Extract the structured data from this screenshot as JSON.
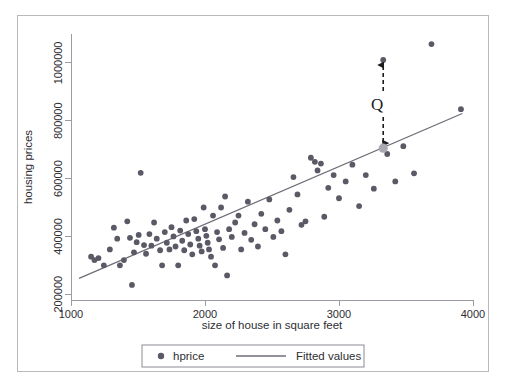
{
  "chart_data": {
    "type": "scatter",
    "title": "",
    "xlabel": "size of house in square feet",
    "ylabel": "housing prices",
    "xlim": [
      1000,
      4000
    ],
    "ylim": [
      180000,
      1100000
    ],
    "xticks": [
      1000,
      2000,
      3000,
      4000
    ],
    "xtick_labels": [
      "1000",
      "2000",
      "3000",
      "4000"
    ],
    "yticks": [
      200000,
      400000,
      600000,
      800000,
      1000000
    ],
    "ytick_labels": [
      "200000",
      "400000",
      "600000",
      "800000",
      "1000000"
    ],
    "grid": false,
    "legend_position": "below-plot",
    "marker_color": "#5a5a66",
    "line_color": "#6e6e78",
    "highlight_marker_color": "#a9a9b2",
    "annotation_color": "#1b1b1f",
    "legend": [
      {
        "label": "hprice",
        "kind": "marker"
      },
      {
        "label": "Fitted values",
        "kind": "line"
      }
    ],
    "series": [
      {
        "name": "hprice",
        "kind": "scatter",
        "points": [
          [
            1150,
            330000
          ],
          [
            1175,
            318000
          ],
          [
            1205,
            325000
          ],
          [
            1245,
            300000
          ],
          [
            1290,
            355000
          ],
          [
            1320,
            430000
          ],
          [
            1345,
            392000
          ],
          [
            1365,
            300000
          ],
          [
            1395,
            318000
          ],
          [
            1420,
            452000
          ],
          [
            1440,
            395000
          ],
          [
            1455,
            232000
          ],
          [
            1470,
            345000
          ],
          [
            1490,
            380000
          ],
          [
            1505,
            405000
          ],
          [
            1520,
            620000
          ],
          [
            1545,
            370000
          ],
          [
            1560,
            340000
          ],
          [
            1585,
            408000
          ],
          [
            1600,
            368000
          ],
          [
            1620,
            448000
          ],
          [
            1640,
            392000
          ],
          [
            1665,
            352000
          ],
          [
            1680,
            300000
          ],
          [
            1700,
            415000
          ],
          [
            1715,
            378000
          ],
          [
            1735,
            355000
          ],
          [
            1750,
            432000
          ],
          [
            1765,
            400000
          ],
          [
            1780,
            365000
          ],
          [
            1800,
            300000
          ],
          [
            1815,
            420000
          ],
          [
            1830,
            385000
          ],
          [
            1845,
            352000
          ],
          [
            1860,
            455000
          ],
          [
            1875,
            408000
          ],
          [
            1890,
            372000
          ],
          [
            1905,
            338000
          ],
          [
            1920,
            460000
          ],
          [
            1935,
            418000
          ],
          [
            1950,
            392000
          ],
          [
            1960,
            368000
          ],
          [
            1975,
            348000
          ],
          [
            1990,
            500000
          ],
          [
            2000,
            425000
          ],
          [
            2010,
            402000
          ],
          [
            2020,
            378000
          ],
          [
            2030,
            355000
          ],
          [
            2045,
            330000
          ],
          [
            2060,
            472000
          ],
          [
            2075,
            300000
          ],
          [
            2090,
            415000
          ],
          [
            2105,
            390000
          ],
          [
            2120,
            500000
          ],
          [
            2135,
            360000
          ],
          [
            2150,
            538000
          ],
          [
            2165,
            265000
          ],
          [
            2180,
            425000
          ],
          [
            2200,
            398000
          ],
          [
            2225,
            448000
          ],
          [
            2250,
            472000
          ],
          [
            2270,
            355000
          ],
          [
            2295,
            412000
          ],
          [
            2320,
            520000
          ],
          [
            2345,
            388000
          ],
          [
            2370,
            442000
          ],
          [
            2395,
            365000
          ],
          [
            2420,
            478000
          ],
          [
            2450,
            425000
          ],
          [
            2480,
            528000
          ],
          [
            2510,
            398000
          ],
          [
            2540,
            455000
          ],
          [
            2570,
            418000
          ],
          [
            2600,
            338000
          ],
          [
            2630,
            492000
          ],
          [
            2660,
            605000
          ],
          [
            2690,
            545000
          ],
          [
            2720,
            440000
          ],
          [
            2750,
            452000
          ],
          [
            2790,
            672000
          ],
          [
            2820,
            658000
          ],
          [
            2840,
            628000
          ],
          [
            2865,
            652000
          ],
          [
            2890,
            468000
          ],
          [
            2920,
            568000
          ],
          [
            2960,
            612000
          ],
          [
            3000,
            532000
          ],
          [
            3050,
            590000
          ],
          [
            3100,
            648000
          ],
          [
            3150,
            505000
          ],
          [
            3200,
            612000
          ],
          [
            3260,
            565000
          ],
          [
            3330,
            1010000
          ],
          [
            3360,
            685000
          ],
          [
            3420,
            590000
          ],
          [
            3480,
            712000
          ],
          [
            3560,
            618000
          ],
          [
            3690,
            1065000
          ],
          [
            3910,
            840000
          ]
        ]
      },
      {
        "name": "Fitted values",
        "kind": "line",
        "points": [
          [
            1060,
            255000
          ],
          [
            3920,
            825000
          ]
        ]
      }
    ],
    "annotations": [
      {
        "label": "Q",
        "kind": "double-arrow-vertical",
        "x": 3330,
        "y_top": 1010000,
        "y_bottom": 705000,
        "highlight_point": [
          3330,
          705000
        ]
      }
    ]
  }
}
